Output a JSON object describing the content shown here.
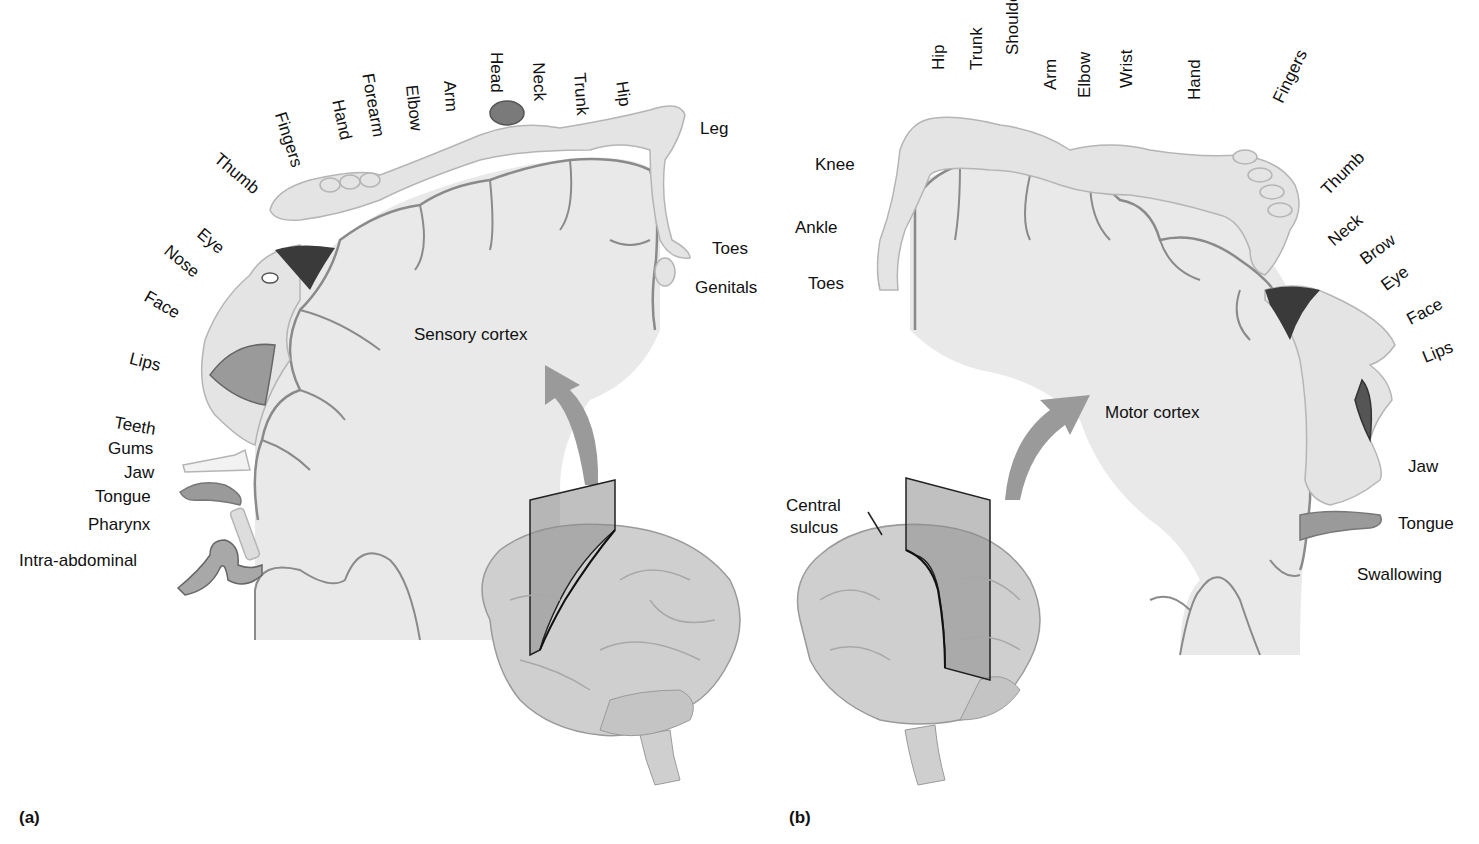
{
  "figure": {
    "panel_a": {
      "tag": "(a)",
      "title": "Sensory cortex",
      "labels": [
        {
          "text": "Thumb",
          "x": 222,
          "y": 150,
          "rot": 40
        },
        {
          "text": "Fingers",
          "x": 288,
          "y": 110,
          "rot": 72
        },
        {
          "text": "Hand",
          "x": 346,
          "y": 98,
          "rot": 78
        },
        {
          "text": "Forearm",
          "x": 376,
          "y": 72,
          "rot": 80
        },
        {
          "text": "Elbow",
          "x": 420,
          "y": 84,
          "rot": 84
        },
        {
          "text": "Arm",
          "x": 458,
          "y": 80,
          "rot": 86
        },
        {
          "text": "Head",
          "x": 505,
          "y": 52,
          "rot": 90
        },
        {
          "text": "Neck",
          "x": 547,
          "y": 62,
          "rot": 88
        },
        {
          "text": "Trunk",
          "x": 588,
          "y": 72,
          "rot": 86
        },
        {
          "text": "Hip",
          "x": 630,
          "y": 80,
          "rot": 82
        },
        {
          "text": "Leg",
          "x": 700,
          "y": 120,
          "rot": 0
        },
        {
          "text": "Toes",
          "x": 712,
          "y": 240,
          "rot": 0
        },
        {
          "text": "Genitals",
          "x": 695,
          "y": 279,
          "rot": 0
        },
        {
          "text": "Eye",
          "x": 205,
          "y": 225,
          "rot": 40
        },
        {
          "text": "Nose",
          "x": 172,
          "y": 242,
          "rot": 40
        },
        {
          "text": "Face",
          "x": 150,
          "y": 288,
          "rot": 30
        },
        {
          "text": "Lips",
          "x": 132,
          "y": 350,
          "rot": 14
        },
        {
          "text": "Teeth",
          "x": 116,
          "y": 414,
          "rot": 10
        },
        {
          "text": "Gums",
          "x": 108,
          "y": 440,
          "rot": 0
        },
        {
          "text": "Jaw",
          "x": 124,
          "y": 464,
          "rot": 0
        },
        {
          "text": "Tongue",
          "x": 95,
          "y": 488,
          "rot": 0
        },
        {
          "text": "Pharynx",
          "x": 88,
          "y": 516,
          "rot": 0
        },
        {
          "text": "Intra-abdominal",
          "x": 19,
          "y": 552,
          "rot": 0
        }
      ]
    },
    "panel_b": {
      "tag": "(b)",
      "title": "Motor cortex",
      "annotation": [
        "Central",
        "sulcus"
      ],
      "labels": [
        {
          "text": "Hip",
          "x": 930,
          "y": 70,
          "rot": -90
        },
        {
          "text": "Trunk",
          "x": 968,
          "y": 70,
          "rot": -90
        },
        {
          "text": "Shoulder",
          "x": 1004,
          "y": 55,
          "rot": -90
        },
        {
          "text": "Arm",
          "x": 1042,
          "y": 90,
          "rot": -90
        },
        {
          "text": "Elbow",
          "x": 1076,
          "y": 98,
          "rot": -90
        },
        {
          "text": "Wrist",
          "x": 1118,
          "y": 88,
          "rot": -90
        },
        {
          "text": "Hand",
          "x": 1186,
          "y": 100,
          "rot": -90
        },
        {
          "text": "Fingers",
          "x": 1270,
          "y": 98,
          "rot": -64
        },
        {
          "text": "Knee",
          "x": 815,
          "y": 156,
          "rot": 0
        },
        {
          "text": "Ankle",
          "x": 795,
          "y": 219,
          "rot": 0
        },
        {
          "text": "Toes",
          "x": 808,
          "y": 275,
          "rot": 0
        },
        {
          "text": "Thumb",
          "x": 1318,
          "y": 186,
          "rot": -45
        },
        {
          "text": "Neck",
          "x": 1325,
          "y": 236,
          "rot": -40
        },
        {
          "text": "Brow",
          "x": 1357,
          "y": 254,
          "rot": -36
        },
        {
          "text": "Eye",
          "x": 1378,
          "y": 280,
          "rot": -36
        },
        {
          "text": "Face",
          "x": 1404,
          "y": 313,
          "rot": -28
        },
        {
          "text": "Lips",
          "x": 1420,
          "y": 350,
          "rot": -22
        },
        {
          "text": "Jaw",
          "x": 1408,
          "y": 458,
          "rot": 0
        },
        {
          "text": "Tongue",
          "x": 1398,
          "y": 515,
          "rot": 0
        },
        {
          "text": "Swallowing",
          "x": 1357,
          "y": 566,
          "rot": 0
        }
      ]
    },
    "colors": {
      "cortex_fill": "#e9e9e9",
      "cortex_stroke": "#8a8a8a",
      "body_fill": "#e4e4e4",
      "arrow": "#9a9a9a",
      "plane": "#9e9e9e",
      "brain": "#cfcfcf"
    }
  }
}
